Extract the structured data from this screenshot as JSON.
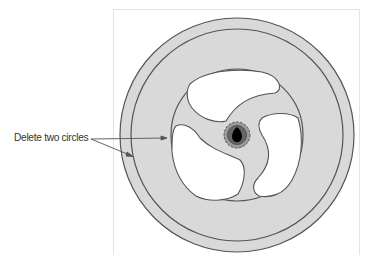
{
  "annotation": {
    "label": "Delete two circles",
    "targets": [
      "inner-circle-edge",
      "outer-ring-band"
    ]
  },
  "figure": {
    "center": [
      237,
      135
    ],
    "outer_circle_radius": 117,
    "ring_circle_radius": 106,
    "inner_circle_radius": 66,
    "hub": {
      "dashed_ring_radius": 13,
      "inner_ring_radius": 9,
      "core_radius": 6
    },
    "spoke_count": 3,
    "colors": {
      "fill": "#d9d9d9",
      "stroke": "#555555",
      "hub_ring": "#888888",
      "hub_core": "#000000",
      "frame": "#e4e4e4"
    }
  }
}
